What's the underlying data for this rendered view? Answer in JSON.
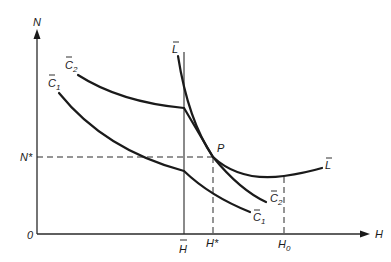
{
  "diagram": {
    "axes": {
      "y_label": "N",
      "x_label": "H",
      "origin_label": "0"
    },
    "ticks": {
      "n_star": "N*",
      "h_bar": "H",
      "h_star": "H*",
      "h_zero": "H",
      "h_zero_sub": "0"
    },
    "curves": {
      "l_bar_top": "L",
      "l_bar_right": "L",
      "c2_top": "C",
      "c2_top_sub": "2",
      "c1_top": "C",
      "c1_top_sub": "1",
      "c2_bottom": "C",
      "c2_bottom_sub": "2",
      "c1_bottom": "C",
      "c1_bottom_sub": "1"
    },
    "point": "P"
  }
}
